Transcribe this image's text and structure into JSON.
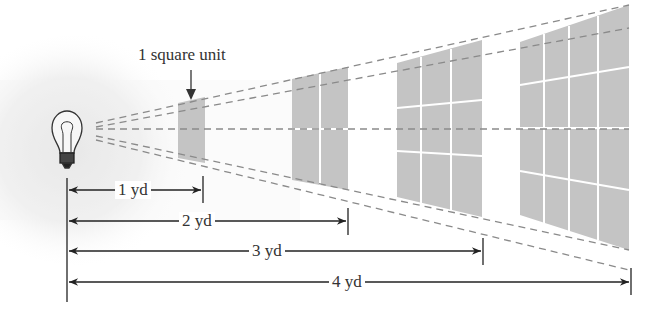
{
  "diagram": {
    "colors": {
      "panel_fill": "#c4c4c4",
      "grid_line": "#ffffff",
      "dash_line": "#8a8a8a",
      "dim_line": "#222222",
      "glow": "#e8e8e8"
    },
    "source": {
      "label": "light-bulb"
    },
    "callout": {
      "text": "1 square unit"
    },
    "panels": [
      {
        "distance": 1,
        "grid": "1x1",
        "area": 1
      },
      {
        "distance": 2,
        "grid": "2x2",
        "area": 4
      },
      {
        "distance": 3,
        "grid": "3x3",
        "area": 9
      },
      {
        "distance": 4,
        "grid": "4x4",
        "area": 16
      }
    ],
    "dimensions": [
      {
        "label": "1 yd"
      },
      {
        "label": "2 yd"
      },
      {
        "label": "3 yd"
      },
      {
        "label": "4 yd"
      }
    ]
  }
}
